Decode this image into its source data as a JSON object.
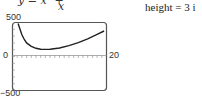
{
  "header": {
    "formula_lhs": "y = x² +",
    "formula_den": "x",
    "caption": "height = 3 i"
  },
  "labels": {
    "ymax": "500",
    "ymin": "−500",
    "xmin": "0",
    "xmax": "20"
  },
  "colors": {
    "curve": "#222222",
    "frame": "#555555",
    "axis": "#888888"
  },
  "chart_data": {
    "type": "line",
    "title": "",
    "xlabel": "",
    "ylabel": "",
    "xlim": [
      0,
      20
    ],
    "ylim": [
      -500,
      500
    ],
    "grid": false,
    "tick_marks": {
      "x_step": 1,
      "y_step": 100
    },
    "series": [
      {
        "name": "y",
        "x": [
          1.2,
          1.5,
          2,
          2.5,
          3,
          4,
          5,
          6,
          7,
          8,
          10,
          12,
          14,
          16,
          18,
          19.5
        ],
        "y": [
          500,
          420,
          320,
          250,
          200,
          150,
          120,
          108,
          105,
          108,
          125,
          160,
          205,
          260,
          325,
          375
        ]
      }
    ]
  }
}
